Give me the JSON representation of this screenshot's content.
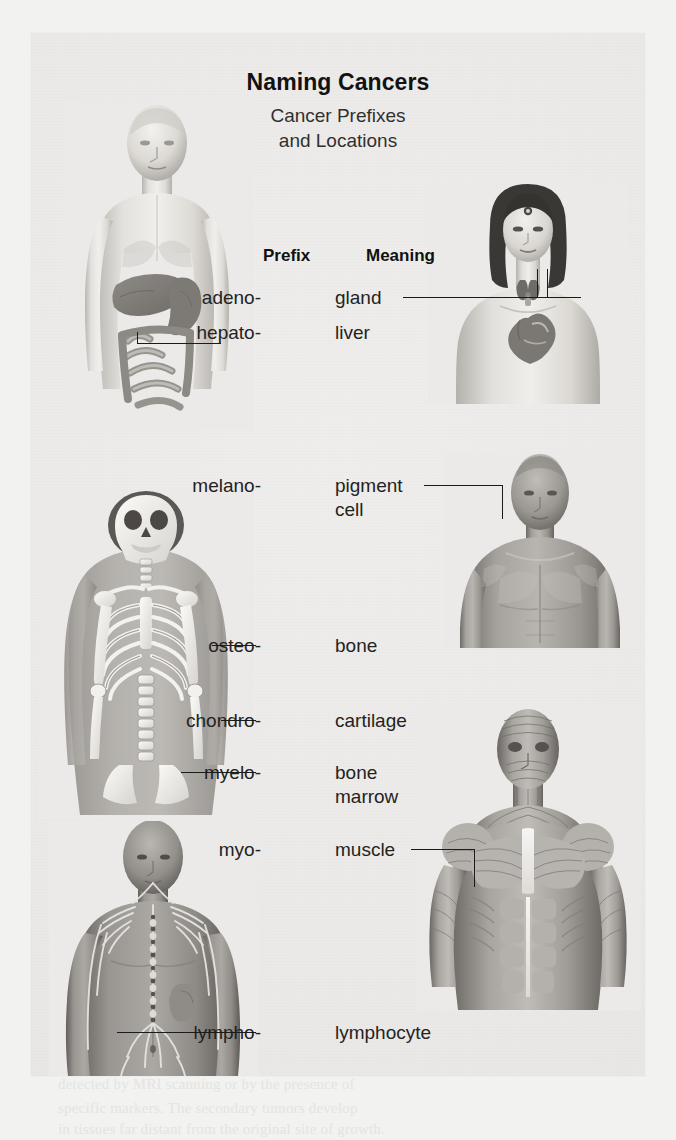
{
  "figure": {
    "title": "Naming Cancers",
    "subtitle_line1": "Cancer Prefixes",
    "subtitle_line2": "and Locations",
    "columns": {
      "prefix": "Prefix",
      "meaning": "Meaning"
    },
    "rows": [
      {
        "prefix": "adeno-",
        "meaning": "gland",
        "meaning_line2": "",
        "leader": "right",
        "target": "thyroid-gland"
      },
      {
        "prefix": "hepato-",
        "meaning": "liver",
        "meaning_line2": "",
        "leader": "left",
        "target": "liver"
      },
      {
        "prefix": "melano-",
        "meaning": "pigment",
        "meaning_line2": "cell",
        "leader": "right",
        "target": "skin"
      },
      {
        "prefix": "osteo-",
        "meaning": "bone",
        "meaning_line2": "",
        "leader": "left",
        "target": "humerus"
      },
      {
        "prefix": "chondro-",
        "meaning": "cartilage",
        "meaning_line2": "",
        "leader": "left",
        "target": "elbow-joint"
      },
      {
        "prefix": "myelo-",
        "meaning": "bone",
        "meaning_line2": "marrow",
        "leader": "left",
        "target": "vertebral-column"
      },
      {
        "prefix": "myo-",
        "meaning": "muscle",
        "meaning_line2": "",
        "leader": "right",
        "target": "pectoral-muscle"
      },
      {
        "prefix": "lympho-",
        "meaning": "lymphocyte",
        "meaning_line2": "",
        "leader": "left",
        "target": "lymphatic-vessel"
      }
    ],
    "illustrations": [
      {
        "name": "male-torso-digestive",
        "caption": "male torso showing liver, stomach and intestines"
      },
      {
        "name": "female-torso-thyroid",
        "caption": "female head and chest showing thyroid gland and heart"
      },
      {
        "name": "skeleton-torso",
        "caption": "skeleton of head, chest, arms and spine"
      },
      {
        "name": "male-torso-skin",
        "caption": "male head and chest, intact skin"
      },
      {
        "name": "male-torso-lymphatic",
        "caption": "male torso showing lymphatic vessels and spleen"
      },
      {
        "name": "male-torso-muscular",
        "caption": "male head and chest showing superficial muscles"
      }
    ],
    "colors": {
      "panel_background": "#eceae8",
      "page_background": "#f2f2f0",
      "text": "#232322",
      "heading": "#111111",
      "leader_line": "#1b1b1b"
    }
  }
}
